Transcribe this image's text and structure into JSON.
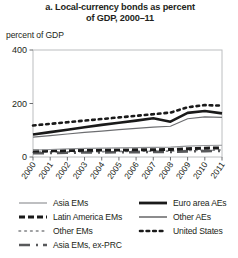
{
  "figure": {
    "title_line1": "a. Local-currency bonds as percent",
    "title_line2": "of GDP, 2000–11",
    "axis_unit_label": "percent of GDP"
  },
  "chart_data": {
    "type": "line",
    "title": "a. Local-currency bonds as percent of GDP, 2000–11",
    "xlabel": "",
    "ylabel": "percent of GDP",
    "ylim": [
      0,
      400
    ],
    "yticks": [
      0,
      200,
      400
    ],
    "grid": false,
    "legend_position": "below",
    "x": [
      "2000",
      "2001",
      "2002",
      "2003",
      "2004",
      "2005",
      "2006",
      "2007",
      "2008",
      "2009",
      "2010",
      "2011"
    ],
    "series": [
      {
        "name": "United States",
        "style": "dotted",
        "color": "#1a1a1a",
        "values": [
          118,
          124,
          130,
          136,
          142,
          148,
          154,
          160,
          166,
          186,
          194,
          192
        ]
      },
      {
        "name": "Euro area AEs",
        "style": "solid-thick",
        "color": "#1a1a1a",
        "values": [
          84,
          93,
          102,
          111,
          120,
          128,
          136,
          145,
          132,
          165,
          172,
          163
        ]
      },
      {
        "name": "Other AEs",
        "style": "solid-thin",
        "color": "#6d6e71",
        "values": [
          74,
          80,
          86,
          92,
          97,
          102,
          107,
          112,
          115,
          143,
          150,
          148
        ]
      },
      {
        "name": "Asia EMs",
        "style": "solid-thin-gray",
        "color": "#939598",
        "values": [
          26,
          28,
          30,
          32,
          33,
          34,
          35,
          36,
          37,
          41,
          43,
          44
        ]
      },
      {
        "name": "Latin America EMs",
        "style": "dashed-thick",
        "color": "#1a1a1a",
        "values": [
          22,
          23,
          24,
          25,
          26,
          26,
          27,
          27,
          28,
          31,
          33,
          34
        ]
      },
      {
        "name": "Other EMs",
        "style": "dotted-fine",
        "color": "#808285",
        "values": [
          18,
          19,
          19,
          20,
          20,
          21,
          21,
          22,
          22,
          24,
          25,
          26
        ]
      },
      {
        "name": "Asia EMs, ex-PRC",
        "style": "dash-dot",
        "color": "#58595b",
        "values": [
          14,
          15,
          16,
          17,
          17,
          18,
          18,
          19,
          19,
          21,
          22,
          23
        ]
      }
    ]
  },
  "legend": {
    "left": [
      {
        "label": "Asia EMs",
        "style": "solid-thin-gray"
      },
      {
        "label": "Latin America EMs",
        "style": "dashed-thick"
      },
      {
        "label": "Other EMs",
        "style": "dotted-fine"
      },
      {
        "label": "Asia EMs, ex-PRC",
        "style": "dash-dot"
      }
    ],
    "right": [
      {
        "label": "Euro area AEs",
        "style": "solid-thick"
      },
      {
        "label": "Other AEs",
        "style": "solid-thin"
      },
      {
        "label": "United States",
        "style": "dotted"
      }
    ]
  }
}
